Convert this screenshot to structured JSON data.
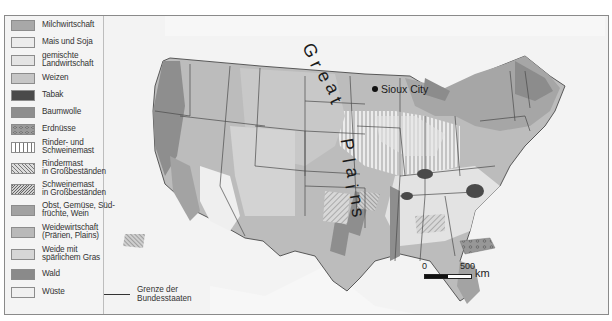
{
  "map": {
    "title": "Landwirtschaftliche Nutzung der USA",
    "region": "USA (contiguous states)",
    "region_label": "Great Plains",
    "region_letters": [
      "G",
      "r",
      "e",
      "a",
      "t",
      "P",
      "l",
      "a",
      "i",
      "n",
      "s"
    ],
    "city": {
      "name": "Sioux City",
      "marker": "filled-circle"
    },
    "scale": {
      "zero": "0",
      "max": "500",
      "unit": "km"
    },
    "credit": "87E"
  },
  "legend": {
    "items": [
      {
        "label": "Milchwirtschaft",
        "color": "#a8a8a8",
        "pattern": "solid"
      },
      {
        "label": "Mais und Soja",
        "color": "#ececec",
        "pattern": "solid"
      },
      {
        "label": "gemischte\nLandwirtschaft",
        "color": "#e4e4e4",
        "pattern": "fine-dots"
      },
      {
        "label": "Weizen",
        "color": "#c6c6c6",
        "pattern": "solid"
      },
      {
        "label": "Tabak",
        "color": "#4a4a4a",
        "pattern": "solid"
      },
      {
        "label": "Baumwolle",
        "color": "#8e8e8e",
        "pattern": "solid"
      },
      {
        "label": "Erdnüsse",
        "color": "#9a9a9a",
        "pattern": "circles"
      },
      {
        "label": "Rinder- und\nSchweinemast",
        "color": "#ffffff",
        "pattern": "vertical-lines"
      },
      {
        "label": "Rindermast\nin Großbeständen",
        "color": "#dcdcdc",
        "pattern": "diagonal-lines"
      },
      {
        "label": "Schweinemast\nin Großbeständen",
        "color": "#d0d0d0",
        "pattern": "dense-diagonal"
      },
      {
        "label": "Obst, Gemüse, Süd-\nfrüchte, Wein",
        "color": "#a2a2a2",
        "pattern": "solid"
      },
      {
        "label": "Weidewirtschaft\n(Prärien, Plains)",
        "color": "#b9b9b9",
        "pattern": "solid"
      },
      {
        "label": "Weide mit\nspärlichem Gras",
        "color": "#d6d6d6",
        "pattern": "solid"
      },
      {
        "label": "Wald",
        "color": "#8a8a8a",
        "pattern": "solid"
      },
      {
        "label": "Wüste",
        "color": "#f0f0f0",
        "pattern": "solid"
      }
    ],
    "border_line": {
      "label": "Grenze der\nBundesstaaten"
    }
  },
  "colors": {
    "background": "#f2f2f2",
    "land_outside": "#f7f7f7",
    "state_border": "#4a4a4a",
    "frame": "#8a8a8a"
  }
}
